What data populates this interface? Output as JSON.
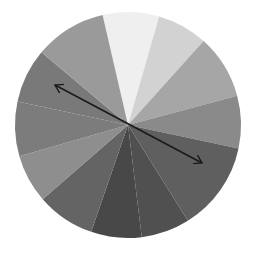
{
  "diagram": {
    "type": "grayscale-color-wheel",
    "center": [
      128,
      125
    ],
    "radius": 113,
    "wedges": [
      {
        "start": -13,
        "end": 16,
        "color": "#efefef"
      },
      {
        "start": 16,
        "end": 42,
        "color": "#d2d2d2"
      },
      {
        "start": 42,
        "end": 75,
        "color": "#a6a6a6"
      },
      {
        "start": 75,
        "end": 102,
        "color": "#8a8a8a"
      },
      {
        "start": 102,
        "end": 148,
        "color": "#5f5f5f"
      },
      {
        "start": 148,
        "end": 173,
        "color": "#505050"
      },
      {
        "start": 173,
        "end": 199,
        "color": "#484848"
      },
      {
        "start": 199,
        "end": 229,
        "color": "#646464"
      },
      {
        "start": 229,
        "end": 254,
        "color": "#8e8e8e"
      },
      {
        "start": 254,
        "end": 282,
        "color": "#7c7c7c"
      },
      {
        "start": 282,
        "end": 310,
        "color": "#797979"
      },
      {
        "start": 310,
        "end": 347,
        "color": "#9a9a9a"
      }
    ],
    "arrow": {
      "x1": 55,
      "y1": 85,
      "x2": 202,
      "y2": 163,
      "color": "#1a1a1a",
      "double_headed": true
    }
  },
  "top_text": ""
}
